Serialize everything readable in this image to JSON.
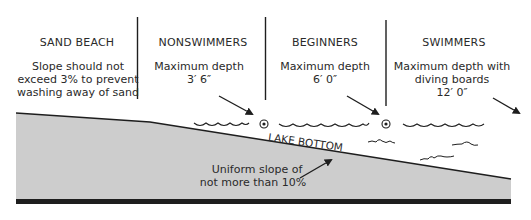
{
  "diagram": {
    "type": "cross-section",
    "colors": {
      "ground_fill": "#cdcdcd",
      "line": "#1e1e1e",
      "text": "#2a2a2a",
      "background": "#ffffff"
    },
    "zones": [
      {
        "heading": "SAND BEACH",
        "lines": [
          "Slope should not",
          "exceed 3% to prevent",
          "washing away of sand"
        ]
      },
      {
        "heading": "NONSWIMMERS",
        "lines": [
          "Maximum depth",
          "3′ 6″"
        ]
      },
      {
        "heading": "BEGINNERS",
        "lines": [
          "Maximum depth",
          "6′ 0″"
        ]
      },
      {
        "heading": "SWIMMERS",
        "lines": [
          "Maximum depth with",
          "diving boards",
          "12′ 0″"
        ]
      }
    ],
    "lake_bottom_label": "LAKE BOTTOM",
    "slope_note": [
      "Uniform slope of",
      "not more than 10%"
    ],
    "icons": [
      "buoy-icon",
      "buoy-icon",
      "wave-icon",
      "arrow-icon"
    ]
  }
}
